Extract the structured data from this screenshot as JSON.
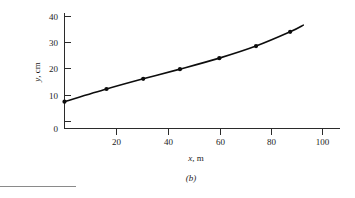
{
  "figure": {
    "caption": "(b)",
    "background_color": "#ffffff",
    "ink_color": "#0d0d0d",
    "axis_color": "#2b2b2b",
    "rule_color": "#8a8a8a"
  },
  "chart_data": {
    "type": "line",
    "title": "",
    "subtitle": "",
    "xlabel": "x, m",
    "xlabel_symbol": "x",
    "xlabel_unit": ", m",
    "ylabel": "y, cm",
    "ylabel_symbol": "y",
    "ylabel_unit": ", cm",
    "xlim": [
      0,
      105
    ],
    "ylim": [
      0,
      43
    ],
    "xticks": [
      0,
      20,
      40,
      60,
      80,
      100
    ],
    "xticklabels": [
      "0",
      "20",
      "40",
      "60",
      "80",
      "100"
    ],
    "yticks": [
      0,
      10,
      20,
      30,
      40
    ],
    "yticklabels": [
      "0",
      "10",
      "20",
      "30",
      "40"
    ],
    "grid": false,
    "legend": null,
    "legend_position": "none",
    "marker": "filled-circle",
    "series": [
      {
        "name": "measured deflection",
        "x": [
          0,
          16,
          30,
          44,
          59,
          73,
          86
        ],
        "values": [
          10.0,
          14.7,
          18.5,
          22.1,
          26.2,
          30.7,
          36.0
        ]
      }
    ],
    "curve_x_end": 91,
    "curve_y_end": 38.5,
    "annotations": []
  }
}
